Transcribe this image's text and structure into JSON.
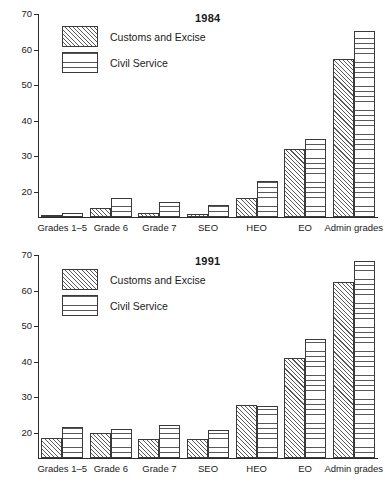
{
  "figure": {
    "categories": [
      "Grades 1–5",
      "Grade 6",
      "Grade 7",
      "SEO",
      "HEO",
      "EO",
      "Admin grades"
    ],
    "series_names": [
      "Customs and Excise",
      "Civil Service"
    ],
    "y_ticks": [
      "70",
      "60",
      "50",
      "40",
      "30",
      "20"
    ],
    "ink_color": "#2b2b2b",
    "hatch_color": "#585858"
  },
  "panels": [
    {
      "title": "1984",
      "legend": [
        {
          "label": "Customs and Excise",
          "pattern": "diagonal-hatch"
        },
        {
          "label": "Civil Service",
          "pattern": "horizontal-hatch"
        }
      ]
    },
    {
      "title": "1991",
      "legend": [
        {
          "label": "Customs and Excise",
          "pattern": "diagonal-hatch"
        },
        {
          "label": "Civil Service",
          "pattern": "horizontal-hatch"
        }
      ]
    }
  ],
  "chart_data": [
    {
      "type": "bar",
      "title": "1984",
      "xlabel": "",
      "ylabel": "",
      "ylim": [
        13,
        70
      ],
      "yticks": [
        20,
        30,
        40,
        50,
        60,
        70
      ],
      "grid": false,
      "legend_position": "top-left",
      "categories": [
        "Grades 1–5",
        "Grade 6",
        "Grade 7",
        "SEO",
        "HEO",
        "EO",
        "Admin grades"
      ],
      "series": [
        {
          "name": "Customs and Excise",
          "values": [
            13.6,
            15.5,
            14.0,
            13.9,
            18.2,
            32.0,
            57.3
          ]
        },
        {
          "name": "Civil Service",
          "values": [
            14.0,
            18.3,
            17.3,
            16.3,
            23.0,
            34.8,
            65.3
          ]
        }
      ]
    },
    {
      "type": "bar",
      "title": "1991",
      "xlabel": "",
      "ylabel": "",
      "ylim": [
        13,
        70
      ],
      "yticks": [
        20,
        30,
        40,
        50,
        60,
        70
      ],
      "grid": false,
      "legend_position": "top-left",
      "categories": [
        "Grades 1–5",
        "Grade 6",
        "Grade 7",
        "SEO",
        "HEO",
        "EO",
        "Admin grades"
      ],
      "series": [
        {
          "name": "Customs and Excise",
          "values": [
            18.6,
            20.1,
            18.3,
            18.2,
            28.0,
            41.0,
            62.4
          ]
        },
        {
          "name": "Civil Service",
          "values": [
            21.8,
            21.1,
            22.4,
            20.9,
            27.5,
            46.4,
            68.4
          ]
        }
      ]
    }
  ]
}
